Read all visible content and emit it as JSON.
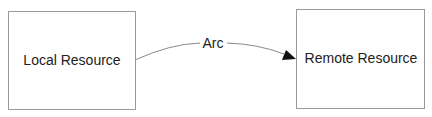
{
  "diagram": {
    "nodes": [
      {
        "id": "local",
        "label": "Local Resource",
        "x": 8,
        "y": 11,
        "w": 127,
        "h": 98
      },
      {
        "id": "remote",
        "label": "Remote Resource",
        "x": 296,
        "y": 9,
        "w": 128,
        "h": 99
      }
    ],
    "edges": [
      {
        "from": "local",
        "to": "remote",
        "label": "Arc",
        "arrow": "end"
      }
    ],
    "colors": {
      "border": "#9a9a9a",
      "edge": "#8a8a8a",
      "arrowhead": "#111111",
      "text": "#222222"
    }
  }
}
